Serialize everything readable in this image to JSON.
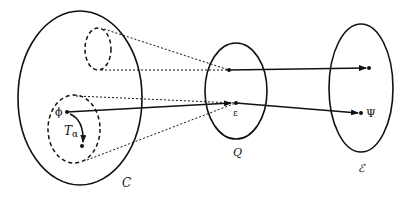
{
  "diagram": {
    "sets": [
      {
        "id": "C",
        "label": "C"
      },
      {
        "id": "Q",
        "label": "Q"
      },
      {
        "id": "E",
        "label": "ℰ"
      }
    ],
    "points": {
      "phi": "ϕ",
      "epsilon": "ε",
      "psi": "Ψ"
    },
    "flow_label": {
      "main": "T",
      "sub": "α"
    },
    "colors": {
      "stroke": "#111111",
      "background": "#ffffff"
    }
  }
}
